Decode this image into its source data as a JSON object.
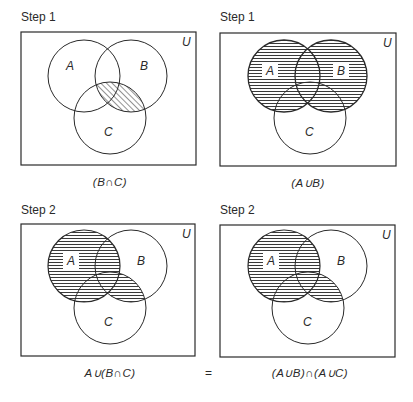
{
  "panels": [
    {
      "step_label": "Step 1",
      "caption": "(B∩C)",
      "universe_label": "U",
      "set_labels": [
        "A",
        "B",
        "C"
      ],
      "shaded_region": "B∩C",
      "shading": "diagonal"
    },
    {
      "step_label": "Step 1",
      "caption": "(A∪B)",
      "universe_label": "U",
      "set_labels": [
        "A",
        "B",
        "C"
      ],
      "shaded_region": "A∪B",
      "shading": "horizontal"
    },
    {
      "step_label": "Step 2",
      "caption": "A∪(B∩C)",
      "universe_label": "U",
      "set_labels": [
        "A",
        "B",
        "C"
      ],
      "shaded_region": "A∪(B∩C)",
      "shading": "horizontal"
    },
    {
      "step_label": "Step 2",
      "caption": "(A∪B)∩(A∪C)",
      "universe_label": "U",
      "set_labels": [
        "A",
        "B",
        "C"
      ],
      "shaded_region": "(A∪B)∩(A∪C)",
      "shading": "horizontal"
    }
  ],
  "equals_sign": "=",
  "colors": {
    "ink": "#2a2a2a",
    "background": "#ffffff"
  }
}
